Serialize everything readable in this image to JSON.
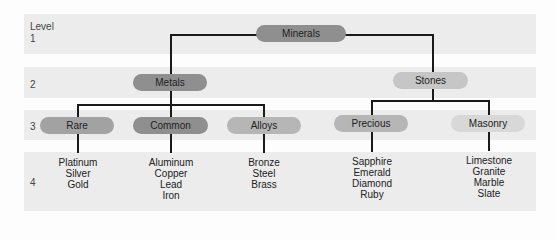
{
  "levels": {
    "header": "Level",
    "items": [
      "1",
      "2",
      "3",
      "4"
    ]
  },
  "tree": {
    "root": {
      "label": "Minerals",
      "color": "#8f8f8f"
    },
    "level2": [
      {
        "label": "Metals",
        "color": "#8f8f8f"
      },
      {
        "label": "Stones",
        "color": "#c6c6c6"
      }
    ],
    "level3": [
      {
        "label": "Rare",
        "color": "#a2a2a2",
        "parent": "Metals"
      },
      {
        "label": "Common",
        "color": "#8f8f8f",
        "parent": "Metals"
      },
      {
        "label": "Alloys",
        "color": "#b6b6b6",
        "parent": "Metals"
      },
      {
        "label": "Precious",
        "color": "#b6b6b6",
        "parent": "Stones"
      },
      {
        "label": "Masonry",
        "color": "#d8d8d8",
        "parent": "Stones"
      }
    ],
    "level4": [
      {
        "parent": "Rare",
        "items": [
          "Platinum",
          "Silver",
          "Gold"
        ]
      },
      {
        "parent": "Common",
        "items": [
          "Aluminum",
          "Copper",
          "Lead",
          "Iron"
        ]
      },
      {
        "parent": "Alloys",
        "items": [
          "Bronze",
          "Steel",
          "Brass"
        ]
      },
      {
        "parent": "Precious",
        "items": [
          "Sapphire",
          "Emerald",
          "Diamond",
          "Ruby"
        ]
      },
      {
        "parent": "Masonry",
        "items": [
          "Limestone",
          "Granite",
          "Marble",
          "Slate"
        ]
      }
    ]
  },
  "colors": {
    "band": "#ececec",
    "connector": "#1a1a1a"
  }
}
